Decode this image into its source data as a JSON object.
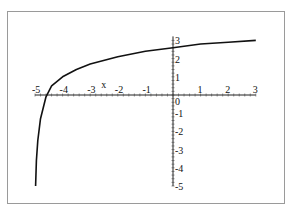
{
  "chart_data": {
    "type": "line",
    "title": "",
    "xlabel": "x",
    "ylabel": "",
    "xlim": [
      -5,
      3
    ],
    "ylim": [
      -5,
      3
    ],
    "x_ticks": [
      "-5",
      "-4",
      "-3",
      "-2",
      "-1",
      "0",
      "1",
      "2",
      "3"
    ],
    "y_ticks": [
      "-5",
      "-4",
      "-3",
      "-2",
      "-1",
      "0",
      "1",
      "2",
      "3"
    ],
    "grid": false,
    "legend": null,
    "series": [
      {
        "name": "curve",
        "x": [
          -4.98,
          -4.95,
          -4.9,
          -4.8,
          -4.6,
          -4.4,
          -4.0,
          -3.5,
          -3.0,
          -2.0,
          -1.0,
          0.0,
          1.0,
          2.0,
          3.0
        ],
        "y": [
          -5.0,
          -3.6,
          -2.5,
          -1.3,
          -0.1,
          0.5,
          1.0,
          1.4,
          1.7,
          2.1,
          2.4,
          2.6,
          2.8,
          2.9,
          3.0
        ]
      }
    ]
  }
}
